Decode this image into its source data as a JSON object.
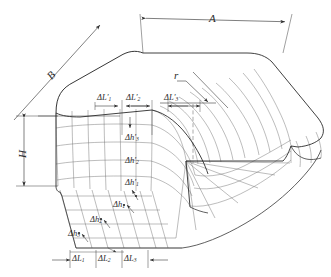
{
  "figure": {
    "type": "engineering-isometric-diagram",
    "background_color": "#ffffff",
    "line_color": "#555555",
    "outline_color": "#2b2b2b",
    "text_color": "#2b2b2b"
  },
  "dimensions": {
    "width_label": "A",
    "depth_label": "B",
    "height_label": "H",
    "radius_label": "r"
  },
  "top_increments": {
    "items": [
      {
        "base": "ΔL",
        "prime": "′",
        "sub": "1"
      },
      {
        "base": "ΔL",
        "prime": "′",
        "sub": "2"
      },
      {
        "base": "ΔL",
        "prime": "′",
        "sub": "3"
      }
    ]
  },
  "wall_increments": {
    "items": [
      {
        "base": "Δh",
        "prime": "′",
        "sub": "3"
      },
      {
        "base": "Δh",
        "prime": "′",
        "sub": "2"
      },
      {
        "base": "Δh",
        "prime": "′",
        "sub": "1"
      }
    ]
  },
  "flange_points": {
    "items": [
      {
        "base": "Δh",
        "prime": "",
        "sub": "1"
      },
      {
        "base": "Δh",
        "prime": "",
        "sub": "2"
      },
      {
        "base": "Δh",
        "prime": "",
        "sub": "3"
      }
    ]
  },
  "bottom_increments": {
    "items": [
      {
        "base": "ΔL",
        "prime": "",
        "sub": "1"
      },
      {
        "base": "ΔL",
        "prime": "",
        "sub": "2"
      },
      {
        "base": "ΔL",
        "prime": "",
        "sub": "3"
      }
    ]
  }
}
